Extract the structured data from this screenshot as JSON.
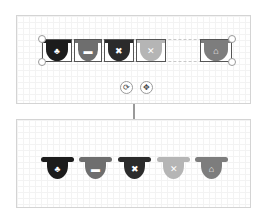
{
  "frames": {
    "top": {
      "label": "editing view"
    },
    "bottom": {
      "label": "result view"
    }
  },
  "icons": [
    {
      "name": "piggy-bank",
      "glyph": "🐷",
      "char": "♣",
      "color": "#1c1c1c"
    },
    {
      "name": "car",
      "glyph": "🚗",
      "char": "▬",
      "color": "#6e6e6e"
    },
    {
      "name": "tools",
      "glyph": "🛠",
      "char": "✖",
      "color": "#2b2b2b"
    },
    {
      "name": "cross",
      "glyph": "✕",
      "char": "✕",
      "color": "#b5b5b5"
    },
    {
      "name": "house",
      "glyph": "⌂",
      "char": "⌂",
      "color": "#7d7d7d"
    }
  ],
  "controls": {
    "rotate_icon": "⟳",
    "move_icon": "✥"
  },
  "icon_chars": {
    "piggy": "♣",
    "car": "▬",
    "tools": "✖",
    "cross": "✕",
    "house": "⌂"
  }
}
